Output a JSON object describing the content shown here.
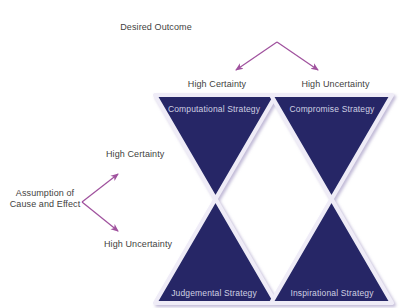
{
  "diagram": {
    "title_top": "Desired Outcome",
    "axis_left": {
      "source_label": "Assumption of Cause and Effect",
      "branch_upper": "High Certainty",
      "branch_lower": "High Uncertainty"
    },
    "axis_top": {
      "source_label": "Desired Outcome",
      "branch_left": "High Certainty",
      "branch_right": "High Uncertainty"
    },
    "cells": [
      {
        "id": "computational",
        "label": "Computational Strategy"
      },
      {
        "id": "compromise",
        "label": "Compromise Strategy"
      },
      {
        "id": "judgemental",
        "label": "Judgemental Strategy"
      },
      {
        "id": "inspirational",
        "label": "Inspirational Strategy"
      }
    ],
    "colors": {
      "triangle_fill": "#252866",
      "triangle_edge": "#e9e6f2",
      "triangle_shadow": "#c9c3dd",
      "arrow": "#a0529e",
      "text": "#3f3f41",
      "cell_text": "#cfd0e2",
      "background": "#ffffff"
    }
  }
}
